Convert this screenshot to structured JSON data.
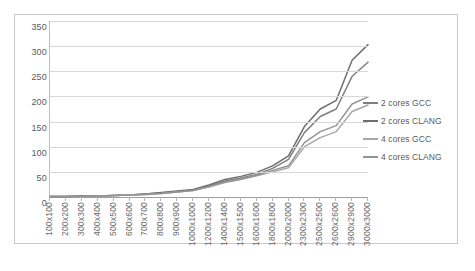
{
  "chart_data": {
    "type": "line",
    "title": "",
    "xlabel": "",
    "ylabel": "",
    "ylim": [
      0,
      350
    ],
    "ytick_step": 50,
    "yticks": [
      350,
      300,
      250,
      200,
      150,
      100,
      50,
      0
    ],
    "grid": true,
    "legend_position": "right",
    "categories": [
      "100x100",
      "200x200",
      "300x300",
      "400x400",
      "500x500",
      "600x600",
      "700x700",
      "800x800",
      "900x900",
      "1000x1000",
      "1200x1200",
      "1400x1400",
      "1500x1500",
      "1600x1600",
      "1800x1800",
      "2000x2000",
      "2300x2300",
      "2500x2500",
      "2600x2600",
      "2900x2900",
      "3000x3000"
    ],
    "series": [
      {
        "name": "2 cores GCC",
        "color": "#7f7f7f",
        "values": [
          1,
          1,
          2,
          2,
          3,
          4,
          6,
          8,
          11,
          14,
          22,
          32,
          38,
          45,
          57,
          75,
          128,
          160,
          175,
          240,
          268
        ]
      },
      {
        "name": "2 cores CLANG",
        "color": "#6e6e6e",
        "values": [
          1,
          1,
          2,
          2,
          3,
          4,
          6,
          9,
          12,
          15,
          24,
          35,
          41,
          49,
          62,
          82,
          140,
          175,
          192,
          272,
          303
        ]
      },
      {
        "name": "4 cores GCC",
        "color": "#a8a8a8",
        "values": [
          1,
          1,
          1,
          2,
          3,
          4,
          5,
          7,
          10,
          13,
          20,
          29,
          35,
          42,
          50,
          58,
          100,
          118,
          130,
          170,
          183
        ]
      },
      {
        "name": "4 cores CLANG",
        "color": "#949494",
        "values": [
          1,
          1,
          1,
          2,
          3,
          4,
          5,
          7,
          10,
          13,
          21,
          30,
          36,
          43,
          53,
          62,
          108,
          130,
          142,
          185,
          199
        ]
      }
    ]
  },
  "legend": {
    "items": [
      {
        "label": "2 cores GCC",
        "color": "#7f7f7f"
      },
      {
        "label": "2 cores CLANG",
        "color": "#6e6e6e"
      },
      {
        "label": "4 cores GCC",
        "color": "#a8a8a8"
      },
      {
        "label": "4 cores CLANG",
        "color": "#949494"
      }
    ]
  }
}
